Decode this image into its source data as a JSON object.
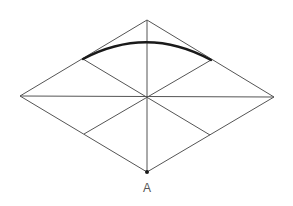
{
  "diagram": {
    "type": "isometric-rhombus-construction",
    "colors": {
      "background": "#ffffff",
      "line": "#555555",
      "arc": "#1a1a1a",
      "label": "#555555"
    },
    "vertices": {
      "top": [
        147,
        20
      ],
      "right": [
        274,
        97
      ],
      "bottom": [
        147,
        172
      ],
      "left": [
        20,
        96
      ],
      "center": [
        147,
        97
      ]
    },
    "edge_midpoints": {
      "upper_left": [
        83,
        59
      ],
      "upper_right": [
        211,
        60
      ],
      "lower_left": [
        84,
        134
      ],
      "lower_right": [
        210,
        135
      ]
    },
    "arc": {
      "from": [
        83,
        59
      ],
      "to": [
        211,
        60
      ],
      "apex": [
        147,
        42
      ],
      "center_point_label": "A"
    },
    "labels": {
      "point_a": "A"
    }
  }
}
